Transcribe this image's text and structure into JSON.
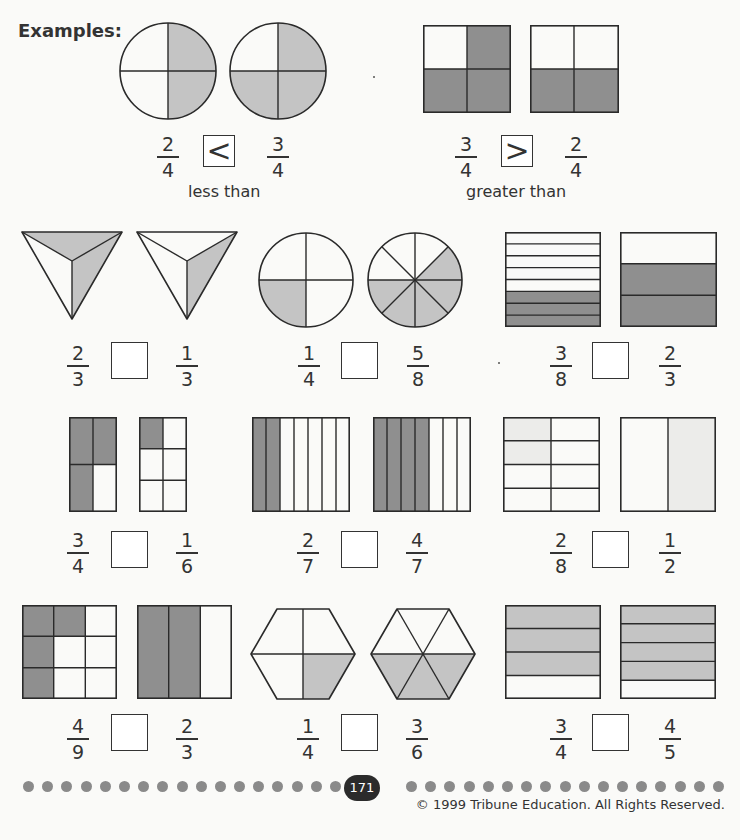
{
  "title": "Examples:",
  "colors": {
    "dark_shade": "#8f8f8f",
    "light_shade": "#c4c4c4",
    "faint_shade": "#ececea",
    "stroke": "#2a2a2a"
  },
  "examples": [
    {
      "left": {
        "num": "2",
        "den": "4"
      },
      "symbol": "<",
      "right": {
        "num": "3",
        "den": "4"
      },
      "caption": "less than",
      "shape": "circle-quarters"
    },
    {
      "left": {
        "num": "3",
        "den": "4"
      },
      "symbol": ">",
      "right": {
        "num": "2",
        "den": "4"
      },
      "caption": "greater than",
      "shape": "square-quarters"
    }
  ],
  "problems": [
    {
      "left": {
        "num": "2",
        "den": "3"
      },
      "symbol": "",
      "right": {
        "num": "1",
        "den": "3"
      },
      "shape": "triangle-thirds"
    },
    {
      "left": {
        "num": "1",
        "den": "4"
      },
      "symbol": "",
      "right": {
        "num": "5",
        "den": "8"
      },
      "shape": "circle-quarters-eighths"
    },
    {
      "left": {
        "num": "3",
        "den": "8"
      },
      "symbol": "",
      "right": {
        "num": "2",
        "den": "3"
      },
      "shape": "horizontal-bars"
    },
    {
      "left": {
        "num": "3",
        "den": "4"
      },
      "symbol": "",
      "right": {
        "num": "1",
        "den": "6"
      },
      "shape": "rect-grid"
    },
    {
      "left": {
        "num": "2",
        "den": "7"
      },
      "symbol": "",
      "right": {
        "num": "4",
        "den": "7"
      },
      "shape": "vertical-strips"
    },
    {
      "left": {
        "num": "2",
        "den": "8"
      },
      "symbol": "",
      "right": {
        "num": "1",
        "den": "2"
      },
      "shape": "square-grid-halves"
    },
    {
      "left": {
        "num": "4",
        "den": "9"
      },
      "symbol": "",
      "right": {
        "num": "2",
        "den": "3"
      },
      "shape": "square-ninths-thirds"
    },
    {
      "left": {
        "num": "1",
        "den": "4"
      },
      "symbol": "",
      "right": {
        "num": "3",
        "den": "6"
      },
      "shape": "hexagon"
    },
    {
      "left": {
        "num": "3",
        "den": "4"
      },
      "symbol": "",
      "right": {
        "num": "4",
        "den": "5"
      },
      "shape": "horizontal-bars-light"
    }
  ],
  "footer": {
    "page_number": "171",
    "copyright": "© 1999 Tribune Education. All Rights Reserved.",
    "dots_left": 17,
    "dots_right": 17
  }
}
